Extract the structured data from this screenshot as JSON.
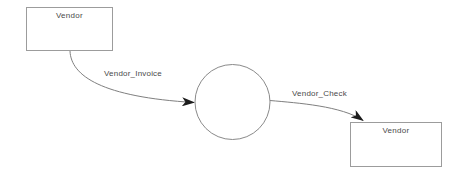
{
  "diagram": {
    "source_entity": {
      "label": "Vendor"
    },
    "target_entity": {
      "label": "Vendor"
    },
    "flows": [
      {
        "label": "Vendor_Invoice"
      },
      {
        "label": "Vendor_Check"
      }
    ],
    "colors": {
      "background": "#ffffff",
      "entity_border": "#9c9c9c",
      "line": "#7f7f7f",
      "circle_stroke": "#8a8a8a",
      "arrowhead": "#1c1c1c",
      "text": "#4a4a4a"
    }
  }
}
